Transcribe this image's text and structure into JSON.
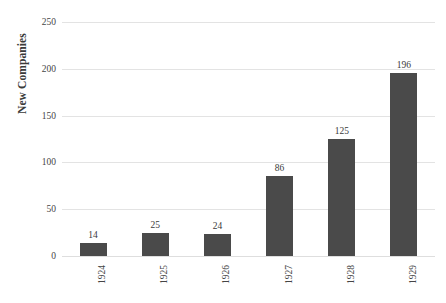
{
  "chart_data": {
    "type": "bar",
    "title": "",
    "subtitle": "",
    "xlabel": "",
    "ylabel": "New Companies",
    "categories": [
      "1924",
      "1925",
      "1926",
      "1927",
      "1928",
      "1929"
    ],
    "values": [
      14,
      25,
      24,
      86,
      125,
      196
    ],
    "data_labels": [
      "14",
      "25",
      "24",
      "86",
      "125",
      "196"
    ],
    "ylim": [
      0,
      250
    ],
    "y_ticks": [
      0,
      50,
      100,
      150,
      200,
      250
    ],
    "y_tick_labels": [
      "0",
      "50",
      "100",
      "150",
      "200",
      "250"
    ],
    "grid": true,
    "grid_axis": "y",
    "legend": false,
    "legend_position": "none",
    "x_tick_rotation": 90,
    "series": [
      {
        "name": "New Companies",
        "values": [
          14,
          25,
          24,
          86,
          125,
          196
        ]
      }
    ]
  },
  "style": {
    "bar_color": "#4a4a4a",
    "grid_color": "#e3e3e3",
    "text_color": "#3f3f3f",
    "background": "#ffffff"
  }
}
